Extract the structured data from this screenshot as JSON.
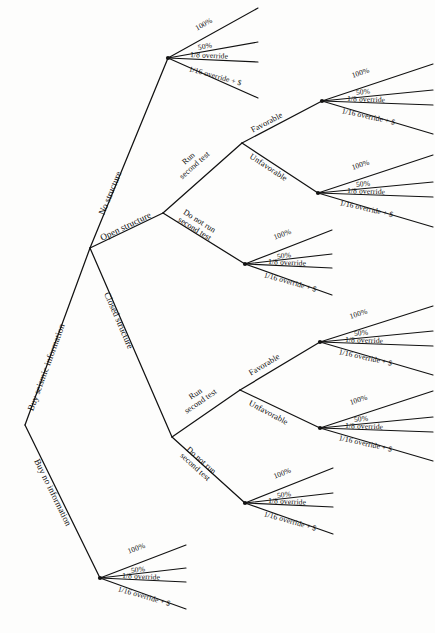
{
  "diagram": {
    "type": "decision-tree",
    "background_color": "#fdfdfc",
    "line_color": "#121212"
  },
  "outcome_set": {
    "items": [
      "100%",
      "50%",
      "1/8 override",
      "1/16 override + $"
    ]
  },
  "root": {
    "branches": [
      {
        "label": "Buy seismic information"
      },
      {
        "label": "Buy no information"
      }
    ]
  },
  "structure_branches": [
    {
      "label": "No structure"
    },
    {
      "label": "Open structure"
    },
    {
      "label": "Closed structure"
    }
  ],
  "test_decisions": [
    {
      "run": "Run second test",
      "run_line1": "Run",
      "run_line2": "second test",
      "norun": "Do not run second test",
      "norun_line1": "Do not run",
      "norun_line2": "second test"
    }
  ],
  "test_results": [
    {
      "label": "Favorable"
    },
    {
      "label": "Unfavorable"
    }
  ],
  "labels": {
    "buy_seismic": "Buy seismic information",
    "buy_none": "Buy no information",
    "no_structure": "No structure",
    "open_structure": "Open structure",
    "closed_structure": "Closed structure",
    "run_test_l1": "Run",
    "run_test_l2": "second test",
    "no_run_test_l1": "Do not run",
    "no_run_test_l2": "second test",
    "favorable": "Favorable",
    "unfavorable": "Unfavorable",
    "o1": "100%",
    "o2": "50%",
    "o3": "1/8  override",
    "o4": "1/16 override + $"
  },
  "fans": [
    {
      "name": "no-structure-outcomes",
      "node": [
        168,
        58
      ]
    },
    {
      "name": "open-favorable-outcomes",
      "node": [
        322,
        101
      ]
    },
    {
      "name": "open-unfavorable-outcomes",
      "node": [
        318,
        193
      ]
    },
    {
      "name": "open-no-test-outcomes",
      "node": [
        245,
        264
      ]
    },
    {
      "name": "closed-favorable-outcomes",
      "node": [
        320,
        342
      ]
    },
    {
      "name": "closed-unfavorable-outcomes",
      "node": [
        320,
        428
      ]
    },
    {
      "name": "closed-no-test-outcomes",
      "node": [
        245,
        503
      ]
    },
    {
      "name": "no-information-outcomes",
      "node": [
        100,
        578
      ]
    }
  ]
}
